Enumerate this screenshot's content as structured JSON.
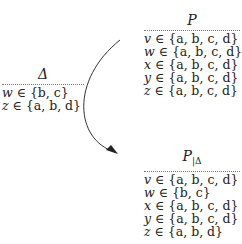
{
  "delta": {
    "title": "Δ",
    "rows": [
      {
        "var": "w",
        "op": " ∈ ",
        "set": "{b, c}"
      },
      {
        "var": "z",
        "op": " ∈ ",
        "set": "{a, b, d}"
      }
    ]
  },
  "p": {
    "title": "P",
    "rows": [
      {
        "var": "v",
        "op": " ∈ ",
        "set": "{a, b, c, d}"
      },
      {
        "var": "w",
        "op": " ∈ ",
        "set": "{a, b, c, d}"
      },
      {
        "var": "x",
        "op": " ∈ ",
        "set": "{a, b, c, d}"
      },
      {
        "var": "y",
        "op": " ∈ ",
        "set": "{a, b, c, d}"
      },
      {
        "var": "z",
        "op": " ∈ ",
        "set": "{a, b, c, d}"
      }
    ]
  },
  "p_restricted": {
    "title": "P",
    "subscript": "|Δ",
    "rows": [
      {
        "var": "v",
        "op": " ∈ ",
        "set": "{a, b, c, d}"
      },
      {
        "var": "w",
        "op": " ∈ ",
        "set": "{b, c}"
      },
      {
        "var": "x",
        "op": " ∈ ",
        "set": "{a, b, c, d}"
      },
      {
        "var": "y",
        "op": " ∈ ",
        "set": "{a, b, c, d}"
      },
      {
        "var": "z",
        "op": " ∈ ",
        "set": "{a, b, d}"
      }
    ]
  },
  "arrow": {
    "from": "P",
    "to": "P|Δ",
    "color": "#333333"
  }
}
